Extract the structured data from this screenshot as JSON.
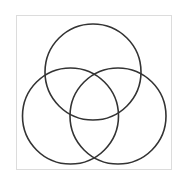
{
  "diagram": {
    "type": "venn",
    "frame": {
      "x": 16,
      "y": 15,
      "width": 155,
      "height": 154,
      "stroke": "#dcdcdc",
      "stroke_width": 1
    },
    "stroke_color": "#333333",
    "stroke_width": 1.6,
    "circles": [
      {
        "id": "top",
        "cx": 93,
        "cy": 72,
        "r": 48
      },
      {
        "id": "bottom-left",
        "cx": 70.5,
        "cy": 116,
        "r": 48
      },
      {
        "id": "bottom-right",
        "cx": 118,
        "cy": 116,
        "r": 48
      }
    ],
    "labels": []
  }
}
